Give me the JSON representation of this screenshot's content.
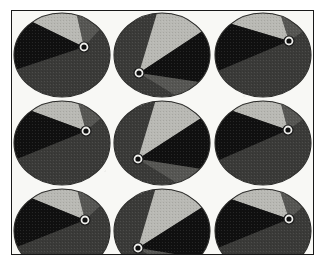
{
  "figure": {
    "type": "scanned-halftone-plate",
    "background_color": "#f8f8f5",
    "border_color": "#1a1a1a",
    "page_background": "#ffffff"
  },
  "palette": {
    "black_sector": "#101010",
    "light_gray_sector": "#b9b9b4",
    "dark_gray_sector": "#3a3a38",
    "mid_gray_sector": "#6e6e6a",
    "disk_outline": "#2a2a28",
    "pivot_ring_stroke": "#1a1a1a",
    "pivot_ring_fill": "#efefec",
    "paper": "#f8f8f5"
  },
  "grid": {
    "rows": 3,
    "columns": 3,
    "count": 9,
    "disk_radius_x": 48,
    "disk_radius_y": 42
  },
  "disks": [
    {
      "index": 1,
      "row": 1,
      "column": 1,
      "label": "disk-r1c1",
      "pivot": {
        "x": 72,
        "y": 36,
        "side": "right",
        "ring_outer_r": 5.0,
        "ring_inner_r": 2.6
      },
      "black_wedge": {
        "start_deg": 160,
        "end_deg": 232
      },
      "light_wedge": {
        "start_deg": 232,
        "end_deg": 288
      },
      "dark_region": {
        "start_deg": 288,
        "end_deg": 160
      }
    },
    {
      "index": 2,
      "row": 1,
      "column": 2,
      "label": "disk-r1c2",
      "pivot": {
        "x": 27,
        "y": 62,
        "side": "lower-left",
        "ring_outer_r": 5.0,
        "ring_inner_r": 2.6
      },
      "black_wedge": {
        "start_deg": -34,
        "end_deg": 40
      },
      "light_wedge": {
        "start_deg": -96,
        "end_deg": -34
      },
      "dark_region": {
        "start_deg": 40,
        "end_deg": -96
      }
    },
    {
      "index": 3,
      "row": 1,
      "column": 3,
      "label": "disk-r1c3",
      "pivot": {
        "x": 76,
        "y": 30,
        "side": "upper-right",
        "ring_outer_r": 5.0,
        "ring_inner_r": 2.6
      },
      "black_wedge": {
        "start_deg": 158,
        "end_deg": 228
      },
      "light_wedge": {
        "start_deg": 228,
        "end_deg": 292
      },
      "dark_region": {
        "start_deg": 292,
        "end_deg": 158
      }
    },
    {
      "index": 4,
      "row": 2,
      "column": 1,
      "label": "disk-r2c1",
      "pivot": {
        "x": 74,
        "y": 32,
        "side": "upper-right",
        "ring_outer_r": 5.0,
        "ring_inner_r": 2.6
      },
      "black_wedge": {
        "start_deg": 158,
        "end_deg": 230
      },
      "light_wedge": {
        "start_deg": 230,
        "end_deg": 290
      },
      "dark_region": {
        "start_deg": 290,
        "end_deg": 158
      }
    },
    {
      "index": 5,
      "row": 2,
      "column": 2,
      "label": "disk-r2c2",
      "pivot": {
        "x": 26,
        "y": 60,
        "side": "lower-left",
        "ring_outer_r": 5.0,
        "ring_inner_r": 2.6
      },
      "black_wedge": {
        "start_deg": -36,
        "end_deg": 38
      },
      "light_wedge": {
        "start_deg": -98,
        "end_deg": -36
      },
      "dark_region": {
        "start_deg": 38,
        "end_deg": -98
      }
    },
    {
      "index": 6,
      "row": 2,
      "column": 3,
      "label": "disk-r2c3",
      "pivot": {
        "x": 75,
        "y": 31,
        "side": "upper-right",
        "ring_outer_r": 5.0,
        "ring_inner_r": 2.6
      },
      "black_wedge": {
        "start_deg": 156,
        "end_deg": 230
      },
      "light_wedge": {
        "start_deg": 230,
        "end_deg": 292
      },
      "dark_region": {
        "start_deg": 292,
        "end_deg": 156
      }
    },
    {
      "index": 7,
      "row": 3,
      "column": 1,
      "label": "disk-r3c1",
      "pivot": {
        "x": 73,
        "y": 33,
        "side": "upper-right",
        "ring_outer_r": 5.0,
        "ring_inner_r": 2.6
      },
      "black_wedge": {
        "start_deg": 158,
        "end_deg": 231
      },
      "light_wedge": {
        "start_deg": 231,
        "end_deg": 289
      },
      "dark_region": {
        "start_deg": 289,
        "end_deg": 158
      }
    },
    {
      "index": 8,
      "row": 3,
      "column": 2,
      "label": "disk-r3c2",
      "pivot": {
        "x": 26,
        "y": 61,
        "side": "lower-left",
        "ring_outer_r": 5.0,
        "ring_inner_r": 2.6
      },
      "black_wedge": {
        "start_deg": -34,
        "end_deg": 40
      },
      "light_wedge": {
        "start_deg": -98,
        "end_deg": -34
      },
      "dark_region": {
        "start_deg": 40,
        "end_deg": -98
      }
    },
    {
      "index": 9,
      "row": 3,
      "column": 3,
      "label": "disk-r3c3",
      "pivot": {
        "x": 76,
        "y": 32,
        "side": "upper-right",
        "ring_outer_r": 5.0,
        "ring_inner_r": 2.6
      },
      "black_wedge": {
        "start_deg": 157,
        "end_deg": 229
      },
      "light_wedge": {
        "start_deg": 229,
        "end_deg": 291
      },
      "dark_region": {
        "start_deg": 291,
        "end_deg": 157
      }
    }
  ]
}
